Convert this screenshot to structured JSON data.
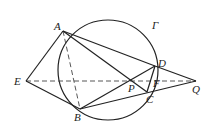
{
  "diagram": {
    "type": "geometry",
    "circle": {
      "label": "Γ",
      "cx": 108,
      "cy": 70,
      "r": 50
    },
    "points": {
      "A": {
        "x": 63,
        "y": 31,
        "label": "A"
      },
      "B": {
        "x": 80,
        "y": 109,
        "label": "B"
      },
      "C": {
        "x": 147,
        "y": 92,
        "label": "C"
      },
      "D": {
        "x": 155,
        "y": 66,
        "label": "D"
      },
      "E": {
        "x": 26,
        "y": 81,
        "label": "E"
      },
      "P": {
        "x": 128,
        "y": 81,
        "label": "P"
      },
      "F": {
        "x": 151,
        "y": 81,
        "label": "F"
      },
      "Q": {
        "x": 196,
        "y": 81,
        "label": "Q"
      }
    },
    "solid_segments": [
      "EA",
      "EB",
      "AD",
      "AC",
      "BD",
      "BQ",
      "DQ",
      "DC"
    ],
    "dashed_segments": [
      "EQ",
      "AB"
    ],
    "labels": {
      "A": "A",
      "B": "B",
      "C": "C",
      "D": "D",
      "E": "E",
      "P": "P",
      "F": "F",
      "Q": "Q",
      "circle": "Γ"
    }
  }
}
